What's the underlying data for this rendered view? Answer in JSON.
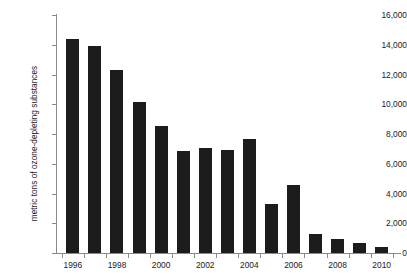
{
  "chart_data": {
    "type": "bar",
    "title": "",
    "subtitle": "",
    "xlabel": "",
    "ylabel": "metric tons of ozone-depleting substances",
    "categories": [
      1996,
      1997,
      1998,
      1999,
      2000,
      2001,
      2002,
      2003,
      2004,
      2005,
      2006,
      2007,
      2008,
      2009,
      2010
    ],
    "values": [
      14400,
      13950,
      12300,
      10150,
      8530,
      6850,
      7060,
      6920,
      7660,
      3290,
      4570,
      1280,
      940,
      670,
      400
    ],
    "series": [
      {
        "name": "metric tons of ozone-depleting substances",
        "values": [
          14400,
          13950,
          12300,
          10150,
          8530,
          6850,
          7060,
          6920,
          7660,
          3290,
          4570,
          1280,
          940,
          670,
          400
        ]
      }
    ],
    "ylim": [
      0,
      16000
    ],
    "y_ticks": [
      0,
      2000,
      4000,
      6000,
      8000,
      10000,
      12000,
      14000,
      16000
    ],
    "y_tick_labels": [
      "0",
      "2,000",
      "4,000",
      "6,000",
      "8,000",
      "10,000",
      "12,000",
      "14,000",
      "16,000"
    ],
    "x_tick_labels": [
      "1996",
      "1998",
      "2000",
      "2002",
      "2004",
      "2006",
      "2008",
      "2010"
    ],
    "x_tick_label_years": [
      1996,
      1998,
      2000,
      2002,
      2004,
      2006,
      2008,
      2010
    ],
    "x_tick_all_years": [
      1996,
      1997,
      1998,
      1999,
      2000,
      2001,
      2002,
      2003,
      2004,
      2005,
      2006,
      2007,
      2008,
      2009,
      2010
    ],
    "grid": false,
    "legend": false,
    "legend_position": "none",
    "bar_color": "#1c1c1c",
    "axis_color": "#8a8a8a",
    "text_color": "#1a1a1a",
    "background_color": "#ffffff"
  }
}
